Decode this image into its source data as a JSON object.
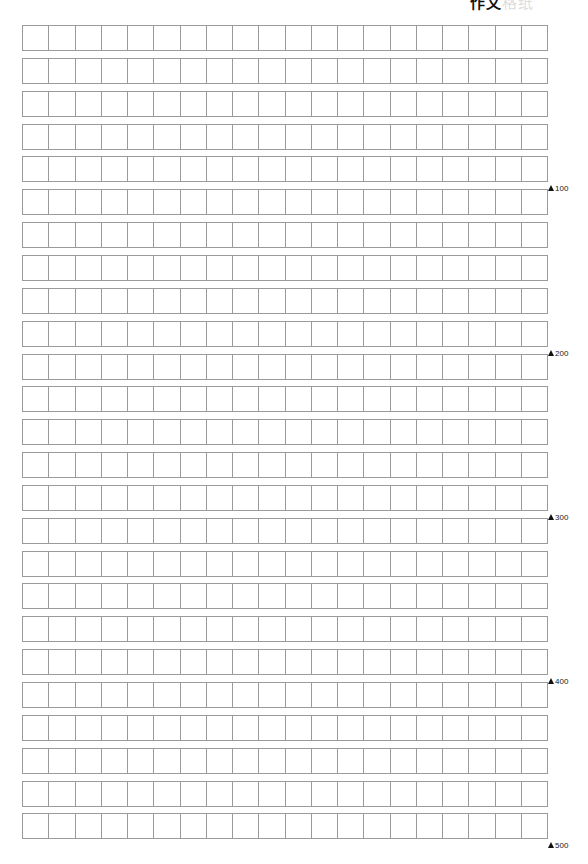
{
  "header": {
    "text_fragment": "作文",
    "faint_fragment": "格纸"
  },
  "grid": {
    "rows": 25,
    "columns": 20,
    "line_color": "#9a9a9a",
    "cells_per_row": 20
  },
  "markers": [
    {
      "label": "100",
      "after_row": 5
    },
    {
      "label": "200",
      "after_row": 10
    },
    {
      "label": "300",
      "after_row": 15
    },
    {
      "label": "400",
      "after_row": 20
    },
    {
      "label": "500",
      "after_row": 25
    }
  ]
}
